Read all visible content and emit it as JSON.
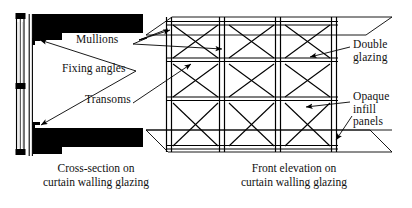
{
  "figure": {
    "type": "architectural-detail-drawing",
    "subject": "Curtain walling glazing",
    "ink_color": "#000000",
    "background_color": "#ffffff"
  },
  "labels": {
    "mullions": "Mullions",
    "fixing_angles": "Fixing angles",
    "transoms": "Transoms",
    "double_glazing_line1": "Double",
    "double_glazing_line2": "glazing",
    "opaque_line1": "Opaque",
    "opaque_line2": "infill",
    "opaque_line3": "panels"
  },
  "captions": {
    "cross_section_line1": "Cross-section on",
    "cross_section_line2": "curtain walling glazing",
    "front_elevation_line1": "Front elevation on",
    "front_elevation_line2": "curtain walling glazing"
  },
  "drawings": {
    "cross_section": {
      "name": "Cross-section on curtain walling glazing",
      "glazing_strip": {
        "x": 18,
        "y": 14,
        "width": 8,
        "height": 140
      },
      "mullion_line": {
        "x": 30,
        "y": 14,
        "height": 140
      },
      "fixing_angle_points": [
        {
          "x": 31,
          "y": 38
        },
        {
          "x": 31,
          "y": 128
        }
      ],
      "floor_slabs": [
        {
          "position": "top",
          "x": 34,
          "y": 14,
          "width": 110,
          "height": 26
        },
        {
          "position": "bottom",
          "x": 34,
          "y": 130,
          "width": 110,
          "height": 26
        }
      ],
      "transom_caps": [
        {
          "y": 14
        },
        {
          "y": 86
        },
        {
          "y": 152
        }
      ]
    },
    "front_elevation": {
      "name": "Front elevation on curtain walling glazing",
      "bays": 3,
      "rows": 3,
      "mullion_x_positions": [
        166,
        222,
        278,
        334
      ],
      "transom_y_positions": [
        22,
        61,
        100,
        148
      ],
      "panel_cross_bracing": true,
      "slab_edges": [
        {
          "position": "top",
          "y": 20
        },
        {
          "position": "mid",
          "y": 130
        },
        {
          "position": "bottom",
          "y": 152
        }
      ]
    }
  }
}
